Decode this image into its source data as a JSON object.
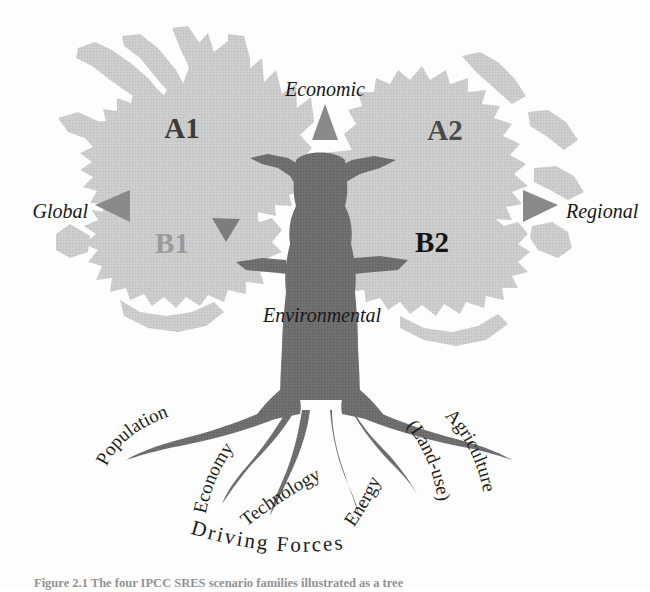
{
  "figure": {
    "domain": "diagram",
    "title_visible": false,
    "caption": "Figure 2.1 The four IPCC SRES scenario families illustrated as a tree",
    "background_color": "#fdfdfd"
  },
  "colors": {
    "canopy_fill": "#c9c9c9",
    "canopy_shade": "#bdbdbd",
    "trunk_fill": "#6e6e6e",
    "trunk_dark": "#636363",
    "arrow_gray": "#8a8a8a",
    "text_dark": "#17171a",
    "label_a1": "#3b3b3b",
    "label_a2": "#4a4a4a",
    "label_b1": "#9a9a9a",
    "label_b2": "#141414"
  },
  "axes": {
    "vertical": {
      "top_label": "Economic",
      "bottom_label": "Environmental",
      "top_arrow": "triangle-up-icon",
      "bottom_arrow": "triangle-down-icon"
    },
    "horizontal": {
      "left_label": "Global",
      "right_label": "Regional",
      "left_arrow": "triangle-left-icon",
      "right_arrow": "triangle-right-icon"
    }
  },
  "quadrants": [
    {
      "id": "a1",
      "label": "A1",
      "position": "top-left",
      "color": "#3b3b3b"
    },
    {
      "id": "a2",
      "label": "A2",
      "position": "top-right",
      "color": "#4a4a4a"
    },
    {
      "id": "b1",
      "label": "B1",
      "position": "bottom-left",
      "color": "#9a9a9a"
    },
    {
      "id": "b2",
      "label": "B2",
      "position": "bottom-right",
      "color": "#141414"
    }
  ],
  "roots": {
    "group_label": "Driving Forces",
    "labels": [
      {
        "id": "population",
        "text": "Population"
      },
      {
        "id": "economy",
        "text": "Economy"
      },
      {
        "id": "technology",
        "text": "Technology"
      },
      {
        "id": "energy",
        "text": "Energy"
      },
      {
        "id": "land-use",
        "text": "(Land-use)"
      },
      {
        "id": "agriculture",
        "text": "Agriculture"
      }
    ]
  }
}
